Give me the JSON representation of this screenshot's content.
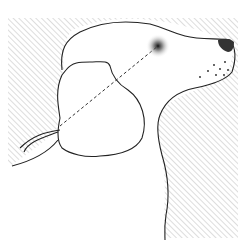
{
  "illustration": {
    "subject": "dog head profile line drawing",
    "colors": {
      "background": "#ffffff",
      "line": "#222222",
      "hatch": "#9a9a9a"
    }
  }
}
